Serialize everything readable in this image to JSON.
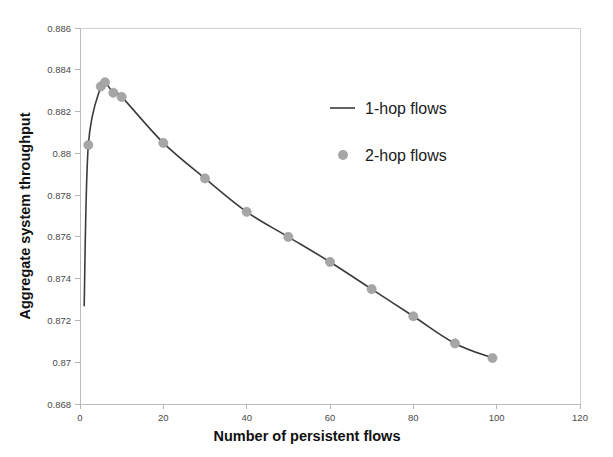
{
  "chart_data": {
    "type": "line",
    "title": "",
    "xlabel": "Number of persistent flows",
    "ylabel": "Aggregate system throughput",
    "xlim": [
      0,
      120
    ],
    "ylim": [
      0.868,
      0.886
    ],
    "xticks": [
      0,
      20,
      40,
      60,
      80,
      100,
      120
    ],
    "xtick_labels": [
      "0",
      "20",
      "40",
      "60",
      "80",
      "100",
      "120"
    ],
    "yticks": [
      0.868,
      0.87,
      0.872,
      0.874,
      0.876,
      0.878,
      0.88,
      0.882,
      0.884,
      0.886
    ],
    "ytick_labels": [
      "0.868",
      "0.87",
      "0.872",
      "0.874",
      "0.876",
      "0.878",
      "0.88",
      "0.882",
      "0.884",
      "0.886"
    ],
    "grid": false,
    "legend_position": "upper-right",
    "series": [
      {
        "name": "1-hop flows",
        "style": "line",
        "color": "#3b3b3b",
        "x": [
          1,
          2,
          5,
          6,
          8,
          10,
          20,
          30,
          40,
          50,
          60,
          70,
          80,
          90,
          99
        ],
        "values": [
          0.8727,
          0.8804,
          0.8832,
          0.8834,
          0.8829,
          0.8827,
          0.8805,
          0.8788,
          0.8772,
          0.876,
          0.8748,
          0.8735,
          0.8722,
          0.8709,
          0.8702
        ]
      },
      {
        "name": "2-hop flows",
        "style": "marker",
        "color": "#a6a6a6",
        "x": [
          2,
          5,
          6,
          8,
          10,
          20,
          30,
          40,
          50,
          60,
          70,
          80,
          90,
          99
        ],
        "values": [
          0.8804,
          0.8832,
          0.8834,
          0.8829,
          0.8827,
          0.8805,
          0.8788,
          0.8772,
          0.876,
          0.8748,
          0.8735,
          0.8722,
          0.8709,
          0.8702
        ]
      }
    ]
  },
  "legend": {
    "entries": [
      {
        "label": "1-hop flows",
        "marker": "line"
      },
      {
        "label": "2-hop flows",
        "marker": "dot"
      }
    ]
  },
  "axes": {
    "x_title": "Number of persistent flows",
    "y_title": "Aggregate system throughput"
  },
  "colors": {
    "line": "#3b3b3b",
    "marker": "#a6a6a6",
    "frame": "#d2d2d2",
    "background": "#ffffff",
    "text": "#1a1a1a",
    "tick_text": "#4a4a4a"
  }
}
